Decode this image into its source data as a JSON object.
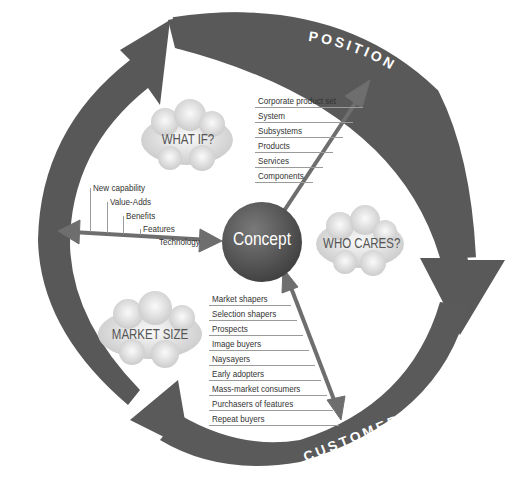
{
  "diagram": {
    "center": "Concept",
    "cycle_labels": [
      "POSITION",
      "CUSTOMER",
      "REINVENT"
    ],
    "clouds": [
      "WHAT IF?",
      "WHO CARES?",
      "MARKET SIZE"
    ],
    "position_list": [
      "Corporate product set",
      "System",
      "Subsystems",
      "Products",
      "Services",
      "Components"
    ],
    "reinvent_list": [
      "New capability",
      "Value-Adds",
      "Benefits",
      "Features",
      "Technology"
    ],
    "customer_list": [
      "Market shapers",
      "Selection shapers",
      "Prospects",
      "Image buyers",
      "Naysayers",
      "Early adopters",
      "Mass-market consumers",
      "Purchasers of features",
      "Repeat buyers"
    ]
  },
  "colors": {
    "band": "#5a5a5a",
    "band_dark": "#3f3f3f",
    "cloud": "#d8d8d8",
    "concept": "#595959",
    "arrow": "#6e6e6e"
  }
}
